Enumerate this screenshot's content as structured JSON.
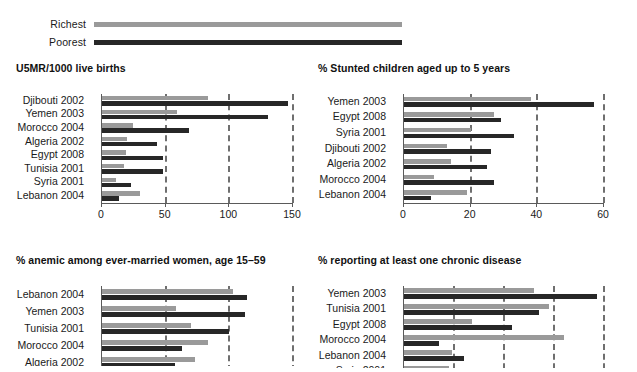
{
  "legend": {
    "items": [
      {
        "key": "richest",
        "label": "Richest",
        "color": "#9a9a9a"
      },
      {
        "key": "poorest",
        "label": "Poorest",
        "color": "#272727"
      }
    ]
  },
  "colors": {
    "richest": "#9a9a9a",
    "poorest": "#272727",
    "axis": "#5a5a5a",
    "grid": "#6f6f6f",
    "text": "#1a1a1a"
  },
  "chart_data": [
    {
      "id": "u5mr",
      "type": "bar",
      "orientation": "horizontal",
      "title": "U5MR/1000 live births",
      "xlabel": "",
      "ylabel": "",
      "xlim": [
        0,
        150
      ],
      "ticks": [
        0,
        50,
        100,
        150
      ],
      "tick_labels": [
        "0",
        "50",
        "100",
        "150"
      ],
      "grid": true,
      "grid_at": [
        50,
        100,
        150
      ],
      "legend_position": "top",
      "categories": [
        "Djibouti 2002",
        "Yemen 2003",
        "Morocco 2004",
        "Algeria 2002",
        "Egypt 2008",
        "Tunisia 2001",
        "Syria 2001",
        "Lebanon 2004"
      ],
      "series": [
        {
          "name": "Richest",
          "values": [
            83,
            59,
            24,
            20,
            19,
            17,
            11,
            30
          ]
        },
        {
          "name": "Poorest",
          "values": [
            146,
            130,
            68,
            43,
            48,
            48,
            23,
            13
          ]
        }
      ]
    },
    {
      "id": "stunted",
      "type": "bar",
      "orientation": "horizontal",
      "title": "% Stunted children aged up to 5 years",
      "xlabel": "",
      "ylabel": "",
      "xlim": [
        0,
        60
      ],
      "ticks": [
        0,
        20,
        40,
        60
      ],
      "tick_labels": [
        "0",
        "20",
        "40",
        "60"
      ],
      "grid": true,
      "grid_at": [
        20,
        40,
        60
      ],
      "legend_position": "top",
      "categories": [
        "Yemen 2003",
        "Egypt 2008",
        "Syria 2001",
        "Djibouti 2002",
        "Algeria 2002",
        "Morocco 2004",
        "Lebanon 2004"
      ],
      "series": [
        {
          "name": "Richest",
          "values": [
            38,
            27,
            20,
            13,
            14,
            9,
            19
          ]
        },
        {
          "name": "Poorest",
          "values": [
            57,
            29,
            33,
            26,
            25,
            27,
            8
          ]
        }
      ]
    },
    {
      "id": "anemic",
      "type": "bar",
      "orientation": "horizontal",
      "title": "% anemic among ever-married women, age 15–59",
      "xlabel": "",
      "ylabel": "",
      "xlim": [
        0,
        150
      ],
      "ticks": [
        0,
        50,
        100,
        150
      ],
      "tick_labels": [
        "0",
        "50",
        "100",
        "150"
      ],
      "grid": true,
      "grid_at": [
        50,
        100,
        150
      ],
      "legend_position": "top",
      "categories": [
        "Lebanon 2004",
        "Yemen 2003",
        "Tunisia 2001",
        "Morocco 2004",
        "Algeria 2002"
      ],
      "series": [
        {
          "name": "Richest",
          "values": [
            103,
            58,
            70,
            83,
            73
          ]
        },
        {
          "name": "Poorest",
          "values": [
            114,
            112,
            100,
            63,
            57
          ]
        }
      ]
    },
    {
      "id": "chronic",
      "type": "bar",
      "orientation": "horizontal",
      "title": "% reporting at least one chronic disease",
      "xlabel": "",
      "ylabel": "",
      "xlim": [
        0,
        80
      ],
      "ticks": [
        0,
        20,
        40,
        60,
        80
      ],
      "tick_labels": [
        "0",
        "20",
        "40",
        "60",
        "80"
      ],
      "grid": true,
      "grid_at": [
        20,
        40,
        60,
        80
      ],
      "legend_position": "top",
      "categories": [
        "Yemen 2003",
        "Tunisia 2001",
        "Egypt 2008",
        "Morocco 2004",
        "Lebanon 2004",
        "Syria 2001"
      ],
      "series": [
        {
          "name": "Richest",
          "values": [
            52,
            58,
            27,
            64,
            19,
            18
          ]
        },
        {
          "name": "Poorest",
          "values": [
            77,
            54,
            43,
            14,
            24,
            0
          ]
        }
      ]
    }
  ]
}
